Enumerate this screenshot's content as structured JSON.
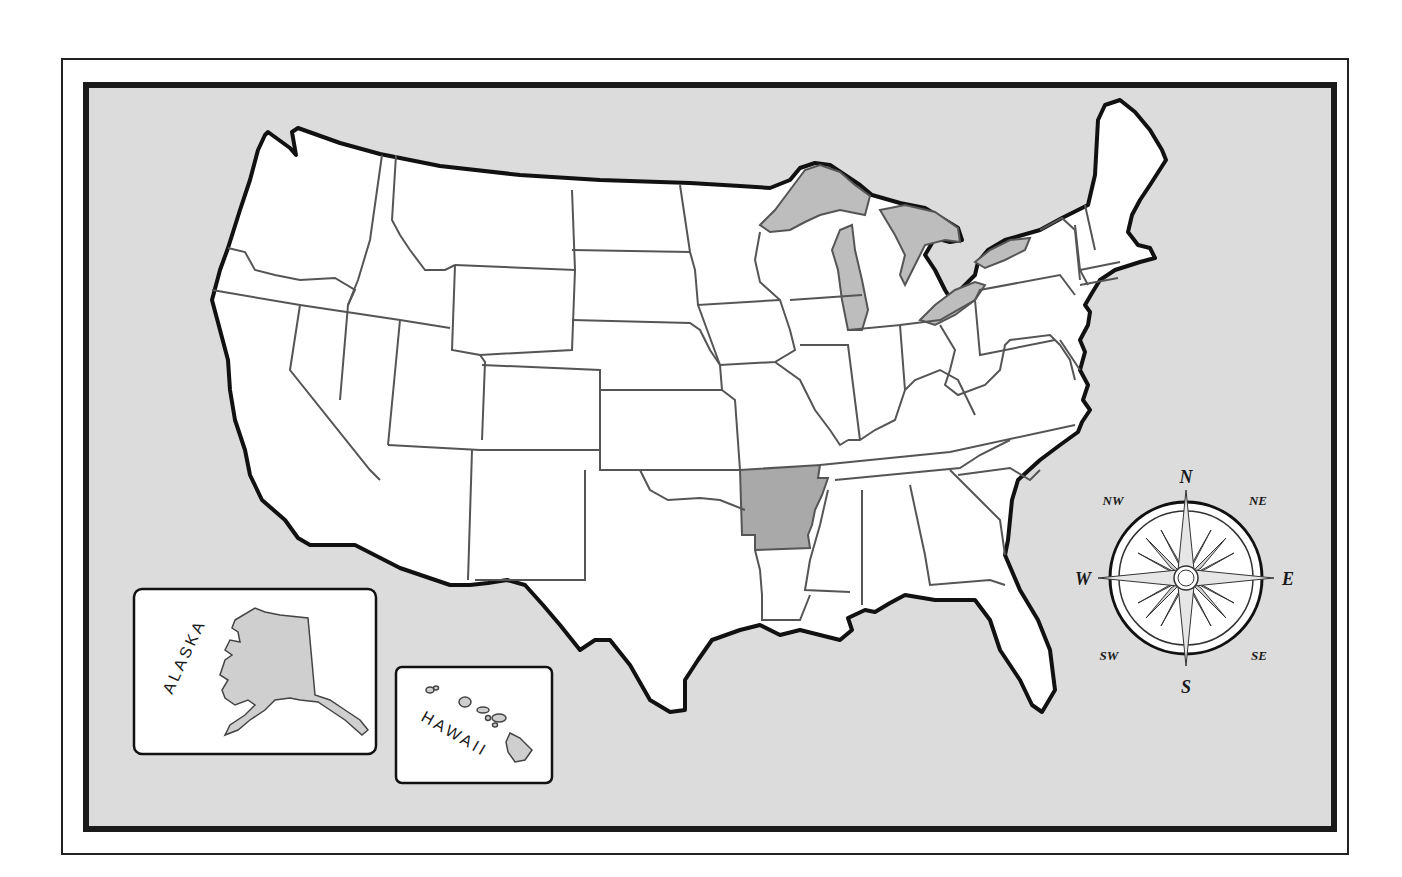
{
  "map": {
    "title": "United States outline map",
    "highlighted_state": "Arkansas",
    "colors": {
      "ocean": "#dcdcdc",
      "land": "#ffffff",
      "highlight": "#a9a9a9",
      "lakes": "#bdbdbd",
      "coast": "#111111",
      "borders": "#555555",
      "frame": "#1a1a1a"
    }
  },
  "insets": {
    "alaska": {
      "label": "ALASKA"
    },
    "hawaii": {
      "label": "HAWAII"
    }
  },
  "compass": {
    "north": "N",
    "south": "S",
    "east": "E",
    "west": "W",
    "northeast": "NE",
    "northwest": "NW",
    "southeast": "SE",
    "southwest": "SW"
  }
}
